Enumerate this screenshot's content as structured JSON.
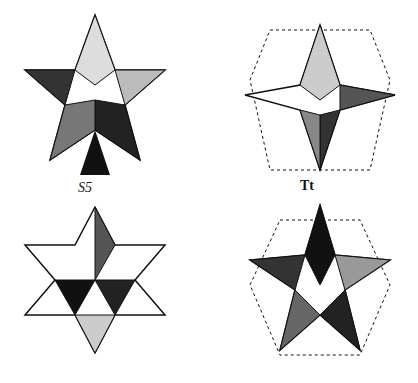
{
  "plate": {
    "figures": [
      {
        "id": "top-left",
        "description": "small stellated dodecahedron, shaded engraving",
        "label": ""
      },
      {
        "id": "top-right",
        "description": "stellated polyhedron with dashed outline edges",
        "label": "Tt"
      },
      {
        "id": "bottom-left",
        "description": "stellated octahedron-like star polyhedron",
        "label": ""
      },
      {
        "id": "bottom-right",
        "description": "great stellated dodecahedron with dashed outline",
        "label": ""
      }
    ],
    "labels": {
      "s5": "S5",
      "tt": "Tt"
    },
    "colors": {
      "ink": "#111111",
      "paper": "#ffffff",
      "hatch": "#555555"
    }
  }
}
